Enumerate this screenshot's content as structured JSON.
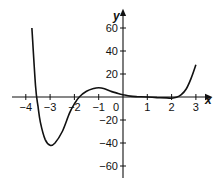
{
  "chart_data": {
    "type": "line",
    "title": "",
    "xlabel": "x",
    "ylabel": "y",
    "xlim": [
      -4.2,
      3.4
    ],
    "ylim": [
      -70,
      68
    ],
    "grid": false,
    "legend": null,
    "x_ticks": [
      -4,
      -3,
      -2,
      -1,
      0,
      1,
      2,
      3
    ],
    "x_tick_labels": [
      "−4",
      "−3",
      "−2",
      "−1",
      "0",
      "1",
      "2",
      "3"
    ],
    "y_ticks": [
      60,
      40,
      20,
      -20,
      -40,
      -60
    ],
    "y_tick_labels": [
      "60",
      "40",
      "20",
      "−20",
      "−40",
      "−60"
    ],
    "series": [
      {
        "name": "f(x)",
        "color": "#111111",
        "x": [
          -3.75,
          -3.6,
          -3.5,
          -3.4,
          -3.2,
          -3.0,
          -2.8,
          -2.5,
          -2.2,
          -2.0,
          -1.8,
          -1.5,
          -1.2,
          -1.0,
          -0.8,
          -0.5,
          -0.2,
          0.0,
          0.3,
          0.6,
          1.0,
          1.4,
          1.8,
          2.0,
          2.2,
          2.4,
          2.6,
          2.8,
          3.0
        ],
        "y": [
          60,
          10,
          -8,
          -22,
          -37,
          -42,
          -40,
          -30,
          -14,
          -6,
          0,
          5,
          7.5,
          8,
          7.5,
          5,
          3,
          2,
          0.8,
          0.3,
          0,
          -0.5,
          -0.8,
          -1,
          -0.3,
          2,
          7,
          16,
          28
        ]
      }
    ],
    "annotations": []
  }
}
